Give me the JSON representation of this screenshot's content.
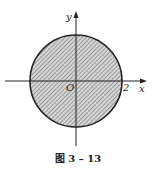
{
  "figure": {
    "caption": "图 3 – 13",
    "axes": {
      "x_label": "x",
      "y_label": "y",
      "origin_label": "O"
    },
    "circle": {
      "center": [
        0,
        0
      ],
      "radius_label": "2",
      "shaded": true
    },
    "colors": {
      "line": "#222222",
      "hatch": "#555555",
      "fill": "#d8d8d8"
    }
  }
}
